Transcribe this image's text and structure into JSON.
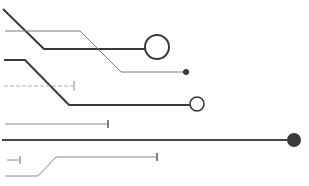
{
  "graphic": {
    "description": "circuit-trace decorative illustration",
    "colors": {
      "background": "#ffffff",
      "dark_trace": "#3a3a3a",
      "light_trace": "#7a7a7a",
      "faint_trace": "#a8a8a8",
      "node_fill": "#3a3a3a"
    }
  }
}
